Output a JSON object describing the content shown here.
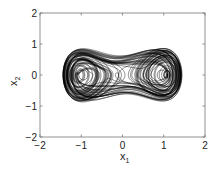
{
  "chart_data": {
    "type": "line",
    "title": "",
    "xlabel": "x1",
    "ylabel": "x2",
    "xlim": [
      -2,
      2
    ],
    "ylim": [
      -2,
      2
    ],
    "xticks": [
      -2,
      -1,
      0,
      1,
      2
    ],
    "yticks": [
      -2,
      -1,
      0,
      1,
      2
    ],
    "xtick_labels": [
      "−2",
      "−1",
      "0",
      "1",
      "2"
    ],
    "ytick_labels": [
      "−2",
      "−1",
      "0",
      "1",
      "2"
    ],
    "grid": false,
    "legend": null,
    "series": [
      {
        "name": "phase portrait trajectory (double-scroll attractor)",
        "description": "Chaotic trajectory in the x1-x2 phase plane, spiraling around two foci near (-0.95, 0) and (0.95, 0); overall extent x1 ≈ [-1.4, 1.45], x2 ≈ [-1.5, 1.5]",
        "foci": [
          [
            -0.95,
            0
          ],
          [
            0.95,
            0
          ]
        ],
        "extent": {
          "x1": [
            -1.4,
            1.45
          ],
          "x2": [
            -1.5,
            1.5
          ]
        },
        "color": "#000000"
      }
    ]
  },
  "axes": {
    "xlabel_main": "x",
    "xlabel_sub": "1",
    "ylabel_main": "x",
    "ylabel_sub": "2"
  }
}
